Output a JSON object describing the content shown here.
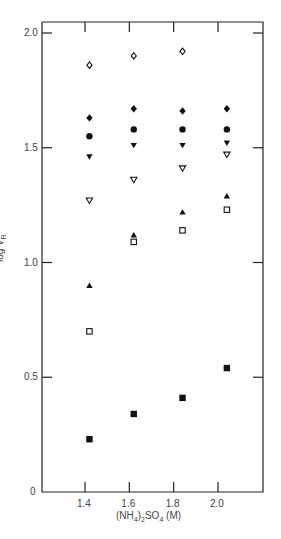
{
  "chart_data": {
    "type": "scatter",
    "title": "",
    "xlabel": "(NH4)2SO4 (M)",
    "ylabel": "log VR",
    "xlim": [
      1.2,
      2.2
    ],
    "ylim": [
      0,
      2.0
    ],
    "x_ticks": [
      "1.4",
      "1.6",
      "1.8",
      "2.0"
    ],
    "y_ticks": [
      "0",
      "0.5",
      "1.0",
      "1.5",
      "2.0"
    ],
    "grid": false,
    "legend": "none",
    "series": [
      {
        "name": "open-diamond",
        "marker": "diamond-open",
        "x": [
          1.42,
          1.62,
          1.84
        ],
        "y": [
          1.86,
          1.9,
          1.92
        ]
      },
      {
        "name": "filled-diamond",
        "marker": "diamond-filled",
        "x": [
          1.42,
          1.62,
          1.84,
          2.04
        ],
        "y": [
          1.63,
          1.67,
          1.66,
          1.67
        ]
      },
      {
        "name": "filled-circle",
        "marker": "circle-filled",
        "x": [
          1.42,
          1.62,
          1.84,
          2.04
        ],
        "y": [
          1.55,
          1.58,
          1.58,
          1.58
        ]
      },
      {
        "name": "filled-down-triangle",
        "marker": "triangle-down-filled",
        "x": [
          1.42,
          1.62,
          1.84,
          2.04
        ],
        "y": [
          1.46,
          1.51,
          1.51,
          1.52
        ]
      },
      {
        "name": "open-down-triangle",
        "marker": "triangle-down-open",
        "x": [
          1.42,
          1.62,
          1.84,
          2.04
        ],
        "y": [
          1.27,
          1.36,
          1.41,
          1.47
        ]
      },
      {
        "name": "filled-up-triangle",
        "marker": "triangle-up-filled",
        "x": [
          1.42,
          1.62,
          1.84,
          2.04
        ],
        "y": [
          0.9,
          1.12,
          1.22,
          1.29
        ]
      },
      {
        "name": "open-square",
        "marker": "square-open",
        "x": [
          1.42,
          1.62,
          1.84,
          2.04
        ],
        "y": [
          0.7,
          1.09,
          1.14,
          1.23
        ]
      },
      {
        "name": "filled-square",
        "marker": "square-filled",
        "x": [
          1.42,
          1.62,
          1.84,
          2.04
        ],
        "y": [
          0.23,
          0.34,
          0.41,
          0.54
        ]
      }
    ]
  },
  "labels": {
    "y_axis_main": "log V",
    "y_axis_sub": "R",
    "x_axis_pre": "(NH",
    "x_axis_sub1": "4",
    "x_axis_mid": ")",
    "x_axis_sub2": "2",
    "x_axis_post": "SO",
    "x_axis_sub3": "4",
    "x_axis_units": " (M)"
  },
  "colors": {
    "axis": "#222222",
    "marker": "#111111",
    "text": "#444444"
  }
}
